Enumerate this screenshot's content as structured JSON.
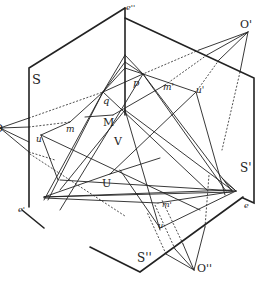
{
  "figure": {
    "type": "geometric-projection-diagram",
    "colors": {
      "ink": "#222222",
      "background": "#ffffff"
    },
    "labels": {
      "plane_s": "S",
      "plane_s_prime": "S'",
      "plane_s_double": "S''",
      "corner_e": "e",
      "corner_e_prime": "e'",
      "corner_e_double": "e''",
      "centre_o": "O",
      "centre_o_prime": "O'",
      "centre_o_double": "O''",
      "point_q": "q",
      "point_p": "p",
      "point_m": "m",
      "point_m_prime": "m'",
      "point_m_prime_low": "m'",
      "point_u": "u",
      "point_u_prime": "u'",
      "point_u_low": "u",
      "point_M": "M",
      "point_V": "V",
      "point_U": "U"
    }
  }
}
